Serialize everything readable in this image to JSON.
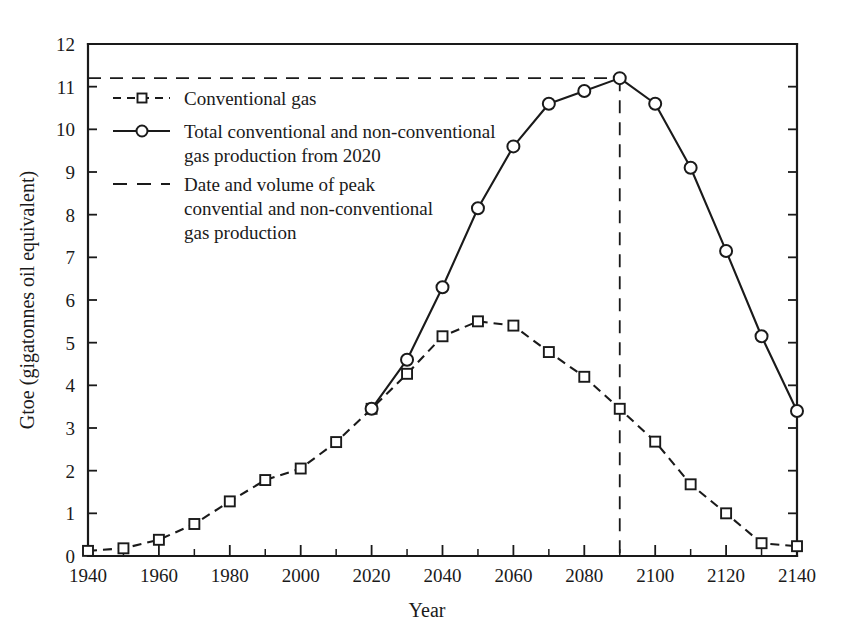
{
  "chart_data": {
    "type": "line",
    "title": "",
    "xlabel": "Year",
    "ylabel": "Gtoe (gigatonnes oil equivalent)",
    "xlim": [
      1940,
      2140
    ],
    "ylim": [
      0,
      12
    ],
    "x_major_ticks": [
      1940,
      1960,
      1980,
      2000,
      2020,
      2040,
      2060,
      2080,
      2100,
      2120,
      2140
    ],
    "x_minor_ticks": [
      1950,
      1970,
      1990,
      2010,
      2030,
      2050,
      2070,
      2090,
      2110,
      2130
    ],
    "x_tick_labels": [
      "1940",
      "1960",
      "1980",
      "2000",
      "2020",
      "2040",
      "2060",
      "2080",
      "2100",
      "2120",
      "2140"
    ],
    "y_ticks": [
      0,
      1,
      2,
      3,
      4,
      5,
      6,
      7,
      8,
      9,
      10,
      11,
      12
    ],
    "y_tick_labels": [
      "0",
      "1",
      "2",
      "3",
      "4",
      "5",
      "6",
      "7",
      "8",
      "9",
      "10",
      "11",
      "12"
    ],
    "grid": false,
    "legend_position": "upper-left-inside",
    "series": [
      {
        "name": "Conventional gas",
        "style": "dashed",
        "marker": "square",
        "x": [
          1940,
          1950,
          1960,
          1970,
          1980,
          1990,
          2000,
          2010,
          2020,
          2030,
          2040,
          2050,
          2060,
          2070,
          2080,
          2090,
          2100,
          2110,
          2120,
          2130,
          2140
        ],
        "values": [
          0.12,
          0.18,
          0.38,
          0.75,
          1.28,
          1.78,
          2.05,
          2.67,
          3.45,
          4.27,
          5.15,
          5.5,
          5.4,
          4.78,
          4.2,
          3.45,
          2.68,
          1.68,
          1.0,
          0.3,
          0.23
        ]
      },
      {
        "name": "Total conventional and non-conventional gas production from 2020",
        "style": "solid",
        "marker": "circle",
        "x": [
          2020,
          2030,
          2040,
          2050,
          2060,
          2070,
          2080,
          2090,
          2100,
          2110,
          2120,
          2130,
          2140
        ],
        "values": [
          3.45,
          4.6,
          6.3,
          8.15,
          9.6,
          10.6,
          10.9,
          11.2,
          10.6,
          9.1,
          7.15,
          5.15,
          3.4
        ]
      }
    ],
    "annotations": [
      {
        "name": "peak-guide",
        "label": "Date and volume of peak convential and non-conventional gas production",
        "x": 2090,
        "y": 11.2,
        "style": "dashed"
      }
    ]
  },
  "legend": {
    "items": [
      {
        "label": "Conventional gas",
        "style": "shortdash",
        "marker": "square"
      },
      {
        "label_line1": "Total conventional and non-conventional",
        "label_line2": "gas production from 2020",
        "style": "solid",
        "marker": "circle"
      },
      {
        "label_line1": "Date and volume of peak",
        "label_line2": "convential and non-conventional",
        "label_line3": "gas production",
        "style": "longdash",
        "marker": "none"
      }
    ]
  },
  "colors": {
    "ink": "#1a1a1a",
    "background": "#ffffff"
  }
}
